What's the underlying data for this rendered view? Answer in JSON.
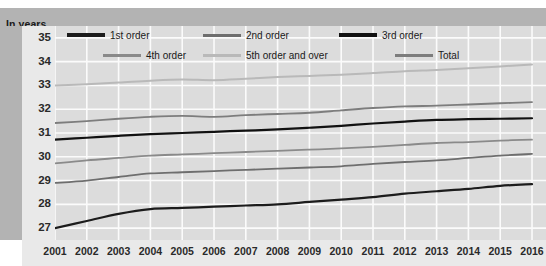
{
  "header": {
    "unit_label": "In years"
  },
  "legend": {
    "items": [
      {
        "label": "1st order",
        "color": "#1c1c1c",
        "thick": true
      },
      {
        "label": "2nd order",
        "color": "#6e6e6e",
        "thick": false
      },
      {
        "label": "3rd order",
        "color": "#111111",
        "thick": true
      },
      {
        "label": "4th order",
        "color": "#8a8a8a",
        "thick": false
      },
      {
        "label": "5th order and over",
        "color": "#b9b9b9",
        "thick": false
      },
      {
        "label": "Total",
        "color": "#7d7d7d",
        "thick": false
      }
    ]
  },
  "chart_data": {
    "type": "line",
    "title": "",
    "subtitle": "",
    "xlabel": "",
    "ylabel": "In years",
    "unit": "years",
    "grid": true,
    "legend_position": "top-inside",
    "xlim": [
      2001,
      2016
    ],
    "ylim": [
      26.5,
      35.5
    ],
    "yticks": [
      27,
      28,
      29,
      30,
      31,
      32,
      33,
      34,
      35
    ],
    "categories": [
      "2001",
      "2002",
      "2003",
      "2004",
      "2005",
      "2006",
      "2007",
      "2008",
      "2009",
      "2010",
      "2011",
      "2012",
      "2013",
      "2014",
      "2015",
      "2016"
    ],
    "series": [
      {
        "name": "1st order",
        "color": "#1c1c1c",
        "width": 2.2,
        "values": [
          27.0,
          27.3,
          27.6,
          27.8,
          27.85,
          27.9,
          27.95,
          28.0,
          28.1,
          28.2,
          28.3,
          28.45,
          28.55,
          28.65,
          28.78,
          28.85
        ]
      },
      {
        "name": "2nd order",
        "color": "#6e6e6e",
        "width": 1.8,
        "values": [
          28.9,
          29.0,
          29.15,
          29.3,
          29.35,
          29.4,
          29.45,
          29.5,
          29.55,
          29.6,
          29.7,
          29.78,
          29.85,
          29.95,
          30.05,
          30.12
        ]
      },
      {
        "name": "3rd order",
        "color": "#111111",
        "width": 2.2,
        "values": [
          30.72,
          30.8,
          30.88,
          30.95,
          31.0,
          31.05,
          31.1,
          31.15,
          31.22,
          31.3,
          31.4,
          31.48,
          31.55,
          31.58,
          31.6,
          31.62
        ]
      },
      {
        "name": "4th order",
        "color": "#8a8a8a",
        "width": 1.8,
        "values": [
          29.72,
          29.85,
          29.95,
          30.05,
          30.1,
          30.15,
          30.2,
          30.25,
          30.3,
          30.35,
          30.42,
          30.5,
          30.58,
          30.62,
          30.68,
          30.72
        ]
      },
      {
        "name": "5th order and over",
        "color": "#b9b9b9",
        "width": 2.0,
        "values": [
          33.0,
          33.05,
          33.12,
          33.2,
          33.25,
          33.22,
          33.28,
          33.35,
          33.4,
          33.45,
          33.52,
          33.6,
          33.65,
          33.72,
          33.8,
          33.88
        ]
      },
      {
        "name": "Total",
        "color": "#7d7d7d",
        "width": 1.9,
        "values": [
          31.42,
          31.5,
          31.6,
          31.68,
          31.72,
          31.68,
          31.75,
          31.8,
          31.85,
          31.95,
          32.05,
          32.12,
          32.15,
          32.2,
          32.25,
          32.3
        ]
      }
    ]
  }
}
